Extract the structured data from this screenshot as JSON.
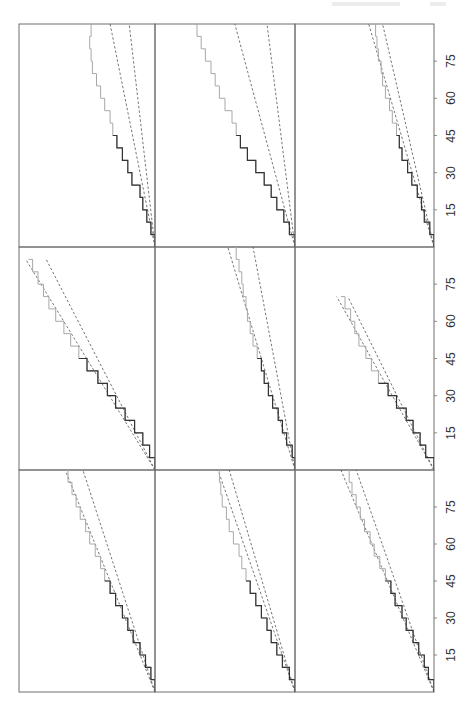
{
  "page": {
    "orientation": "rotated-90-ccw",
    "background": "#ffffff"
  },
  "chart_data": {
    "type": "line",
    "layout": {
      "rows": 3,
      "cols": 3,
      "shared_x_axis": true,
      "grid": false
    },
    "x_axis": {
      "ticks": [
        15,
        30,
        45,
        60,
        75
      ],
      "tick_labels": [
        "15",
        "30",
        "45",
        "60",
        "75"
      ],
      "range": [
        0,
        90
      ],
      "label": ""
    },
    "y_axis": {
      "ticks": [],
      "label": ""
    },
    "colors": {
      "frame": "#6e6e6e",
      "dashed_bounds": "#555555",
      "series_dark": "#333333",
      "series_light": "#a8a8a8"
    },
    "panels": [
      {
        "row": 0,
        "col": 0,
        "bound_upper": [
          [
            0,
            0
          ],
          [
            90,
            0.33
          ]
        ],
        "bound_lower": [
          [
            0,
            0
          ],
          [
            90,
            0.19
          ]
        ],
        "series": [
          [
            0,
            0
          ],
          [
            5,
            0.03
          ],
          [
            10,
            0.06
          ],
          [
            15,
            0.09
          ],
          [
            20,
            0.11
          ],
          [
            25,
            0.17
          ],
          [
            30,
            0.2
          ],
          [
            35,
            0.24
          ],
          [
            40,
            0.28
          ],
          [
            45,
            0.31
          ],
          [
            50,
            0.33
          ],
          [
            55,
            0.37
          ],
          [
            60,
            0.4
          ],
          [
            65,
            0.43
          ],
          [
            70,
            0.46
          ],
          [
            75,
            0.47
          ],
          [
            80,
            0.48
          ],
          [
            85,
            0.47
          ],
          [
            90,
            0.46
          ]
        ]
      },
      {
        "row": 0,
        "col": 1,
        "bound_upper": [
          [
            0,
            0
          ],
          [
            90,
            0.43
          ]
        ],
        "bound_lower": [
          [
            0,
            0
          ],
          [
            90,
            0.2
          ]
        ],
        "series": [
          [
            0,
            0
          ],
          [
            5,
            0.04
          ],
          [
            10,
            0.08
          ],
          [
            15,
            0.13
          ],
          [
            20,
            0.17
          ],
          [
            25,
            0.22
          ],
          [
            30,
            0.28
          ],
          [
            35,
            0.34
          ],
          [
            40,
            0.39
          ],
          [
            45,
            0.42
          ],
          [
            50,
            0.45
          ],
          [
            55,
            0.5
          ],
          [
            60,
            0.54
          ],
          [
            65,
            0.57
          ],
          [
            70,
            0.6
          ],
          [
            75,
            0.64
          ],
          [
            80,
            0.67
          ],
          [
            85,
            0.7
          ],
          [
            90,
            0.72
          ]
        ]
      },
      {
        "row": 0,
        "col": 2,
        "bound_upper": [
          [
            0,
            0
          ],
          [
            90,
            0.47
          ]
        ],
        "bound_lower": [
          [
            0,
            0
          ],
          [
            90,
            0.37
          ]
        ],
        "series": [
          [
            0,
            0
          ],
          [
            5,
            0.03
          ],
          [
            10,
            0.07
          ],
          [
            15,
            0.09
          ],
          [
            20,
            0.12
          ],
          [
            25,
            0.16
          ],
          [
            30,
            0.19
          ],
          [
            35,
            0.23
          ],
          [
            40,
            0.25
          ],
          [
            45,
            0.27
          ],
          [
            50,
            0.3
          ],
          [
            55,
            0.32
          ],
          [
            60,
            0.35
          ],
          [
            65,
            0.37
          ],
          [
            70,
            0.38
          ],
          [
            75,
            0.4
          ],
          [
            80,
            0.41
          ],
          [
            85,
            0.42
          ],
          [
            90,
            0.43
          ]
        ]
      },
      {
        "row": 1,
        "col": 0,
        "bound_upper": [
          [
            0,
            0
          ],
          [
            85,
            0.95
          ]
        ],
        "bound_lower": [
          [
            0,
            0
          ],
          [
            85,
            0.8
          ]
        ],
        "series": [
          [
            0,
            0
          ],
          [
            5,
            0.04
          ],
          [
            10,
            0.09
          ],
          [
            15,
            0.15
          ],
          [
            20,
            0.22
          ],
          [
            25,
            0.29
          ],
          [
            30,
            0.35
          ],
          [
            35,
            0.42
          ],
          [
            40,
            0.5
          ],
          [
            45,
            0.56
          ],
          [
            50,
            0.62
          ],
          [
            55,
            0.67
          ],
          [
            60,
            0.73
          ],
          [
            65,
            0.78
          ],
          [
            70,
            0.82
          ],
          [
            75,
            0.86
          ],
          [
            80,
            0.9
          ],
          [
            85,
            0.93
          ]
        ]
      },
      {
        "row": 1,
        "col": 1,
        "bound_upper": [
          [
            0,
            0
          ],
          [
            90,
            0.48
          ]
        ],
        "bound_lower": [
          [
            0,
            0
          ],
          [
            90,
            0.3
          ]
        ],
        "series": [
          [
            0,
            0
          ],
          [
            5,
            0.02
          ],
          [
            10,
            0.06
          ],
          [
            15,
            0.09
          ],
          [
            20,
            0.12
          ],
          [
            25,
            0.16
          ],
          [
            30,
            0.19
          ],
          [
            35,
            0.22
          ],
          [
            40,
            0.24
          ],
          [
            45,
            0.27
          ],
          [
            50,
            0.3
          ],
          [
            55,
            0.32
          ],
          [
            60,
            0.34
          ],
          [
            65,
            0.35
          ],
          [
            70,
            0.37
          ],
          [
            75,
            0.38
          ],
          [
            80,
            0.4
          ],
          [
            85,
            0.42
          ],
          [
            90,
            0.43
          ]
        ]
      },
      {
        "row": 1,
        "col": 2,
        "bound_upper": [
          [
            0,
            0
          ],
          [
            70,
            0.7
          ]
        ],
        "bound_lower": [
          [
            0,
            0
          ],
          [
            70,
            0.62
          ]
        ],
        "series": [
          [
            0,
            0
          ],
          [
            5,
            0.06
          ],
          [
            10,
            0.1
          ],
          [
            15,
            0.15
          ],
          [
            20,
            0.2
          ],
          [
            25,
            0.27
          ],
          [
            30,
            0.33
          ],
          [
            35,
            0.4
          ],
          [
            40,
            0.45
          ],
          [
            45,
            0.49
          ],
          [
            50,
            0.54
          ],
          [
            55,
            0.57
          ],
          [
            60,
            0.6
          ],
          [
            65,
            0.64
          ],
          [
            70,
            0.67
          ]
        ]
      },
      {
        "row": 2,
        "col": 0,
        "bound_upper": [
          [
            0,
            0
          ],
          [
            90,
            0.66
          ]
        ],
        "bound_lower": [
          [
            0,
            0
          ],
          [
            90,
            0.53
          ]
        ],
        "series": [
          [
            0,
            0
          ],
          [
            5,
            0.03
          ],
          [
            10,
            0.07
          ],
          [
            15,
            0.11
          ],
          [
            20,
            0.16
          ],
          [
            25,
            0.2
          ],
          [
            30,
            0.24
          ],
          [
            35,
            0.29
          ],
          [
            40,
            0.33
          ],
          [
            45,
            0.37
          ],
          [
            50,
            0.4
          ],
          [
            55,
            0.44
          ],
          [
            60,
            0.48
          ],
          [
            65,
            0.51
          ],
          [
            70,
            0.55
          ],
          [
            75,
            0.58
          ],
          [
            80,
            0.61
          ],
          [
            85,
            0.64
          ],
          [
            90,
            0.67
          ]
        ]
      },
      {
        "row": 2,
        "col": 1,
        "bound_upper": [
          [
            0,
            0
          ],
          [
            90,
            0.55
          ]
        ],
        "bound_lower": [
          [
            0,
            0
          ],
          [
            90,
            0.47
          ]
        ],
        "series": [
          [
            0,
            0
          ],
          [
            5,
            0.04
          ],
          [
            10,
            0.09
          ],
          [
            15,
            0.13
          ],
          [
            20,
            0.17
          ],
          [
            25,
            0.2
          ],
          [
            30,
            0.24
          ],
          [
            35,
            0.28
          ],
          [
            40,
            0.32
          ],
          [
            45,
            0.35
          ],
          [
            50,
            0.38
          ],
          [
            55,
            0.4
          ],
          [
            60,
            0.44
          ],
          [
            65,
            0.47
          ],
          [
            70,
            0.49
          ],
          [
            75,
            0.52
          ],
          [
            80,
            0.53
          ],
          [
            85,
            0.54
          ],
          [
            90,
            0.55
          ]
        ]
      },
      {
        "row": 2,
        "col": 2,
        "bound_upper": [
          [
            0,
            0
          ],
          [
            90,
            0.67
          ]
        ],
        "bound_lower": [
          [
            0,
            0
          ],
          [
            90,
            0.56
          ]
        ],
        "series": [
          [
            0,
            0
          ],
          [
            5,
            0.04
          ],
          [
            10,
            0.07
          ],
          [
            15,
            0.11
          ],
          [
            20,
            0.15
          ],
          [
            25,
            0.2
          ],
          [
            30,
            0.23
          ],
          [
            35,
            0.28
          ],
          [
            40,
            0.31
          ],
          [
            45,
            0.35
          ],
          [
            50,
            0.39
          ],
          [
            55,
            0.43
          ],
          [
            60,
            0.46
          ],
          [
            65,
            0.5
          ],
          [
            70,
            0.53
          ],
          [
            75,
            0.56
          ],
          [
            80,
            0.59
          ],
          [
            85,
            0.61
          ],
          [
            90,
            0.63
          ]
        ]
      }
    ]
  }
}
